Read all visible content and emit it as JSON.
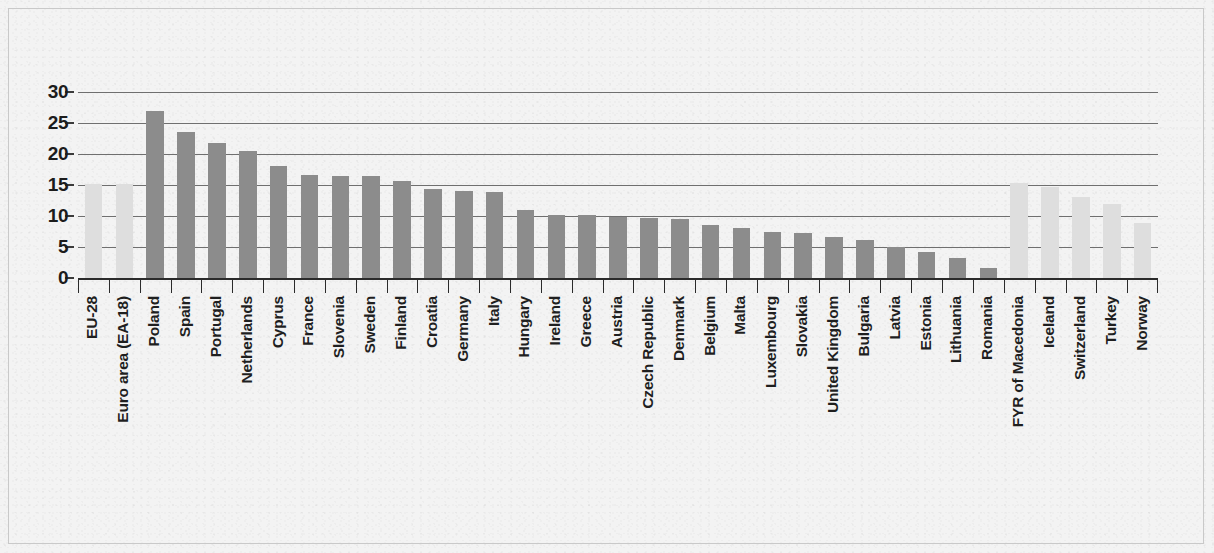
{
  "chart_data": {
    "type": "bar",
    "title": "",
    "subtitle": "",
    "xlabel": "",
    "ylabel": "",
    "ylim": [
      0,
      30
    ],
    "yticks": [
      0,
      5,
      10,
      15,
      20,
      25,
      30
    ],
    "ytick_labels": [
      "0",
      "5",
      "10",
      "15",
      "20",
      "25",
      "30"
    ],
    "grid": true,
    "legend": "none",
    "series_name": "",
    "categories": [
      "EU-28",
      "Euro area (EA-18)",
      "Poland",
      "Spain",
      "Portugal",
      "Netherlands",
      "Cyprus",
      "France",
      "Slovenia",
      "Sweden",
      "Finland",
      "Croatia",
      "Germany",
      "Italy",
      "Hungary",
      "Ireland",
      "Greece",
      "Austria",
      "Czech Republic",
      "Denmark",
      "Belgium",
      "Malta",
      "Luxembourg",
      "Slovakia",
      "United Kingdom",
      "Bulgaria",
      "Latvia",
      "Estonia",
      "Lithuania",
      "Romania",
      "FYR of Macedonia",
      "Iceland",
      "Switzerland",
      "Turkey",
      "Norway"
    ],
    "values": [
      15.2,
      15.2,
      27.0,
      23.6,
      21.8,
      20.5,
      18.0,
      16.6,
      16.5,
      16.5,
      15.6,
      14.3,
      14.0,
      13.8,
      11.0,
      10.2,
      10.2,
      9.8,
      9.6,
      9.5,
      8.6,
      8.1,
      7.5,
      7.2,
      6.6,
      6.1,
      5.0,
      4.2,
      3.3,
      1.6,
      15.4,
      14.6,
      13.0,
      12.0,
      8.9
    ],
    "bar_styles": [
      "light",
      "light",
      "dark",
      "dark",
      "dark",
      "dark",
      "dark",
      "dark",
      "dark",
      "dark",
      "dark",
      "dark",
      "dark",
      "dark",
      "dark",
      "dark",
      "dark",
      "dark",
      "dark",
      "dark",
      "dark",
      "dark",
      "dark",
      "dark",
      "dark",
      "dark",
      "dark",
      "dark",
      "dark",
      "dark",
      "light",
      "light",
      "light",
      "light",
      "light"
    ],
    "gap_after_index": 29,
    "colors": {
      "bar_dark": "#8c8c8c",
      "bar_light": "#dedede",
      "gridline": "#6f6f6f",
      "axis": "#2b2b2b",
      "text": "#1f1f1f",
      "background": "#f3f3f3",
      "frame_border": "#c9c9c9"
    }
  }
}
